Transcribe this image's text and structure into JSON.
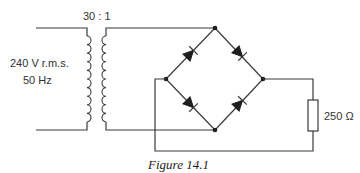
{
  "figure": {
    "caption": "Figure 14.1",
    "type": "bridge-rectifier-circuit"
  },
  "source": {
    "voltage_label": "240 V r.m.s.",
    "frequency_label": "50 Hz"
  },
  "transformer": {
    "ratio_label": "30 : 1"
  },
  "bridge": {
    "diodes": [
      "top-left",
      "top-right",
      "bottom-left",
      "bottom-right"
    ],
    "nodes": [
      "top",
      "left",
      "right",
      "bottom"
    ]
  },
  "load": {
    "resistance_label": "250 Ω"
  },
  "colors": {
    "wire": "#3a3a3a",
    "diode": "#1e1e1e",
    "text": "#333333",
    "background": "#ffffff"
  }
}
